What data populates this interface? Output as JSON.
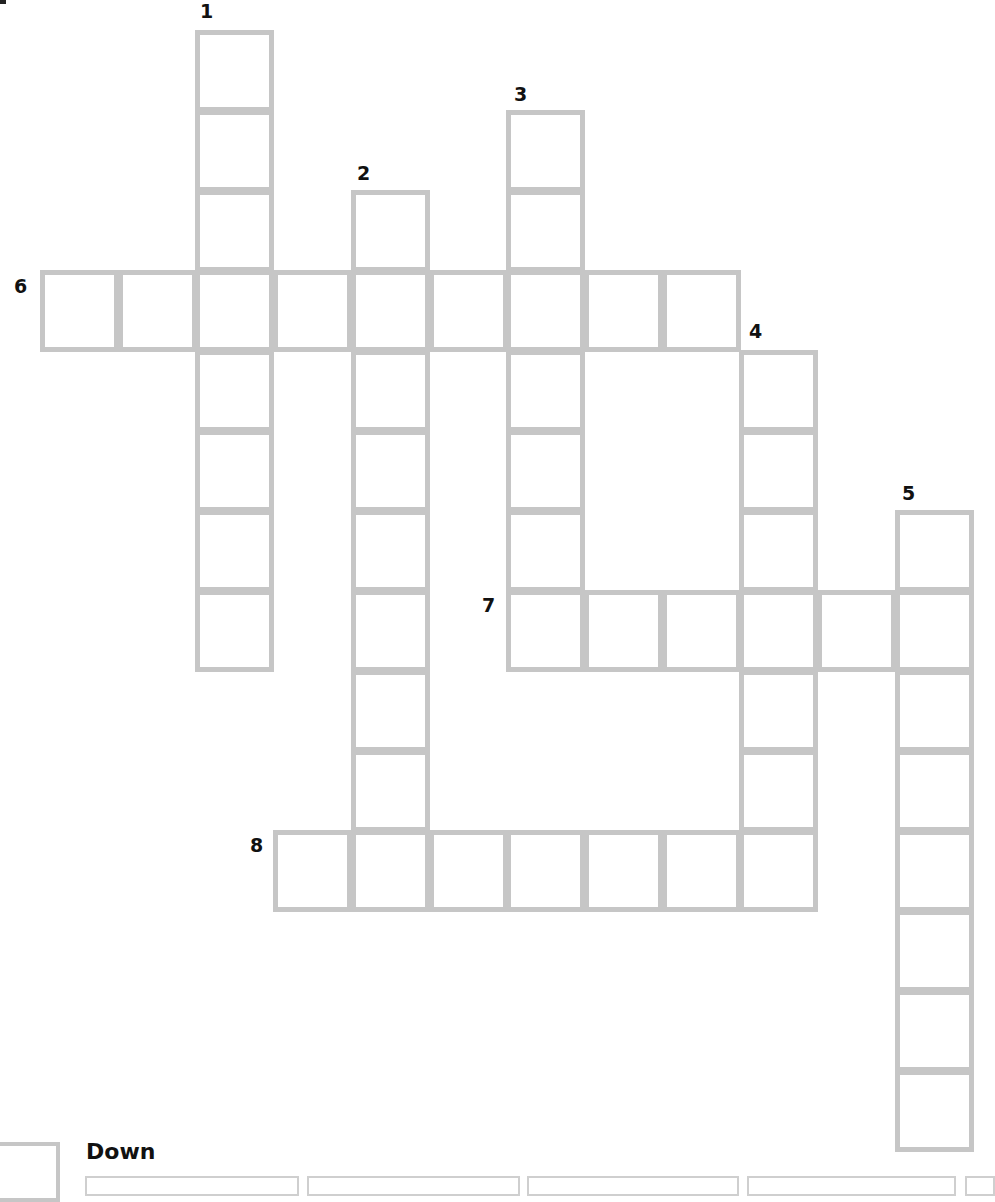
{
  "puzzle": {
    "type": "crossword",
    "colors": {
      "grid_line": "#c6c6c6",
      "number": "#111111",
      "background": "#ffffff"
    },
    "grid": {
      "origin_x": 40,
      "origin_y": 30,
      "pitch_x": 77.7,
      "pitch_y": 80,
      "cell_w": 79,
      "cell_h": 82
    },
    "words": [
      {
        "number": "1",
        "direction": "down",
        "col": 2,
        "row": 0,
        "length": 8
      },
      {
        "number": "2",
        "direction": "down",
        "col": 4,
        "row": 2,
        "length": 8
      },
      {
        "number": "3",
        "direction": "down",
        "col": 6,
        "row": 1,
        "length": 7
      },
      {
        "number": "4",
        "direction": "down",
        "col": 9,
        "row": 4,
        "length": 7
      },
      {
        "number": "5",
        "direction": "down",
        "col": 11,
        "row": 6,
        "length": 8
      },
      {
        "number": "6",
        "direction": "across",
        "col": 0,
        "row": 3,
        "length": 9
      },
      {
        "number": "7",
        "direction": "across",
        "col": 6,
        "row": 7,
        "length": 6
      },
      {
        "number": "8",
        "direction": "across",
        "col": 3,
        "row": 10,
        "length": 7
      }
    ],
    "labels": [
      {
        "number": "1",
        "x": 200,
        "y": 2
      },
      {
        "number": "2",
        "x": 357,
        "y": 164
      },
      {
        "number": "3",
        "x": 514,
        "y": 85
      },
      {
        "number": "4",
        "x": 749,
        "y": 322
      },
      {
        "number": "5",
        "x": 902,
        "y": 484
      },
      {
        "number": "6",
        "x": 14,
        "y": 277
      },
      {
        "number": "7",
        "x": 482,
        "y": 596
      },
      {
        "number": "8",
        "x": 250,
        "y": 836
      }
    ]
  },
  "clues_section": {
    "down_heading": "Down",
    "visible_clue_boxes": [
      {
        "left": 85,
        "width": 214
      },
      {
        "left": 307,
        "width": 213
      },
      {
        "left": 527,
        "width": 212
      },
      {
        "left": 747,
        "width": 209
      },
      {
        "left": 965,
        "width": 30
      }
    ]
  }
}
